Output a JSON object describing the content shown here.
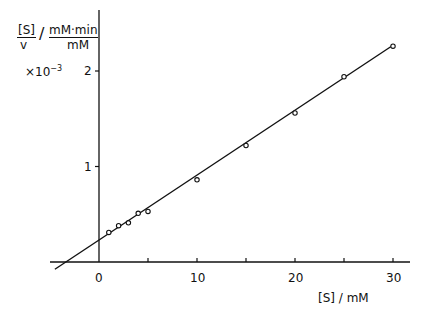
{
  "chart_data": {
    "type": "scatter",
    "title": "",
    "xlabel": "[S] / mM",
    "ylabel": "[S]/v / mM·min/mM",
    "ylabel_parts": {
      "fraction_numerator": "[S]",
      "fraction_denominator": "v",
      "unit_numerator": "mM·min",
      "unit_denominator": "mM",
      "multiplier": "×10",
      "multiplier_exponent": "-3"
    },
    "x_ticks": [
      0,
      10,
      20,
      30
    ],
    "x_minor_ticks": [
      5,
      15,
      25
    ],
    "y_ticks": [
      1,
      2
    ],
    "xlim": [
      -5,
      32
    ],
    "ylim": [
      -0.25,
      2.6
    ],
    "grid": false,
    "legend": null,
    "series": [
      {
        "name": "data",
        "marker": "open-circle",
        "x": [
          1,
          2,
          3,
          4,
          5,
          10,
          15,
          20,
          25,
          30
        ],
        "y": [
          0.31,
          0.38,
          0.41,
          0.51,
          0.53,
          0.86,
          1.22,
          1.56,
          1.94,
          2.26
        ]
      },
      {
        "name": "fit",
        "type": "line",
        "slope": 0.068,
        "intercept": 0.23,
        "x_range": [
          -4.5,
          30
        ]
      }
    ],
    "annotations": []
  },
  "labels": {
    "x_axis": "[S] / mM",
    "x_tick_0": "0",
    "x_tick_10": "10",
    "x_tick_20": "20",
    "x_tick_30": "30",
    "y_tick_1": "1",
    "y_tick_2": "2",
    "y_num": "[S]",
    "y_den": "v",
    "y_slash": "/",
    "y_unit_num": "mM·min",
    "y_unit_den": "mM",
    "y_mult": "×10",
    "y_mult_exp": "−3"
  }
}
